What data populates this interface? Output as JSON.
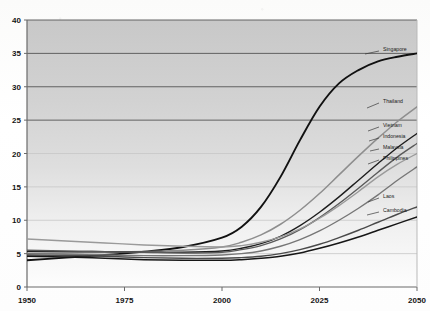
{
  "chart_data": {
    "type": "line",
    "title": "",
    "subtitle": "",
    "xlabel": "",
    "ylabel": "",
    "xlim": [
      1950,
      2050
    ],
    "ylim": [
      0,
      40
    ],
    "x_ticks": [
      "1950",
      "1975",
      "2000",
      "2025",
      "2050"
    ],
    "x_tick_values": [
      1950,
      1975,
      2000,
      2025,
      2050
    ],
    "y_ticks": [
      "0",
      "5",
      "10",
      "15",
      "20",
      "25",
      "30",
      "35",
      "40"
    ],
    "y_tick_values": [
      0,
      5,
      10,
      15,
      20,
      25,
      30,
      35,
      40
    ],
    "grid": "horizontal",
    "legend_position": "right-inline-labels",
    "plot_background": "#d0d0d0",
    "x": [
      1950,
      1960,
      1970,
      1980,
      1990,
      2000,
      2005,
      2010,
      2015,
      2020,
      2025,
      2030,
      2035,
      2040,
      2045,
      2050
    ],
    "series": [
      {
        "name": "Singapore",
        "color": "#111111",
        "width": 1.9,
        "values": [
          4.0,
          4.4,
          4.8,
          5.3,
          6.0,
          7.4,
          9.0,
          12.0,
          16.5,
          22.0,
          27.0,
          30.5,
          32.5,
          33.8,
          34.5,
          35.0
        ]
      },
      {
        "name": "Thailand",
        "color": "#8e8e8e",
        "width": 1.5,
        "values": [
          5.0,
          5.1,
          5.2,
          5.3,
          5.5,
          6.0,
          6.7,
          7.8,
          9.4,
          11.5,
          14.0,
          16.8,
          19.6,
          22.3,
          24.8,
          27.0
        ]
      },
      {
        "name": "Vietnam",
        "color": "#1d1d1d",
        "width": 1.4,
        "values": [
          5.3,
          5.3,
          5.3,
          5.2,
          5.2,
          5.4,
          5.8,
          6.5,
          7.6,
          9.2,
          11.2,
          13.5,
          16.0,
          18.5,
          20.9,
          23.0
        ]
      },
      {
        "name": "Indonesia",
        "color": "#5a5a5a",
        "width": 1.4,
        "values": [
          5.5,
          5.4,
          5.3,
          5.2,
          5.1,
          5.2,
          5.6,
          6.2,
          7.2,
          8.6,
          10.4,
          12.5,
          14.8,
          17.2,
          19.5,
          21.5
        ]
      },
      {
        "name": "Malaysia",
        "color": "#9a9a9a",
        "width": 1.4,
        "values": [
          7.2,
          6.9,
          6.6,
          6.3,
          6.1,
          6.0,
          6.2,
          6.7,
          7.5,
          8.7,
          10.3,
          12.2,
          14.3,
          16.5,
          18.4,
          20.0
        ]
      },
      {
        "name": "Philippines",
        "color": "#767676",
        "width": 1.4,
        "values": [
          5.0,
          4.9,
          4.8,
          4.7,
          4.7,
          4.8,
          5.0,
          5.4,
          6.1,
          7.1,
          8.4,
          10.0,
          11.8,
          13.8,
          16.0,
          18.0
        ]
      },
      {
        "name": "Laos",
        "color": "#4a4a4a",
        "width": 1.4,
        "values": [
          4.8,
          4.7,
          4.6,
          4.4,
          4.3,
          4.3,
          4.4,
          4.6,
          5.0,
          5.6,
          6.4,
          7.4,
          8.5,
          9.7,
          10.9,
          12.0
        ]
      },
      {
        "name": "Cambodia",
        "color": "#161616",
        "width": 1.5,
        "values": [
          4.6,
          4.5,
          4.3,
          4.1,
          4.0,
          4.0,
          4.1,
          4.3,
          4.6,
          5.1,
          5.8,
          6.6,
          7.5,
          8.5,
          9.5,
          10.5
        ]
      }
    ],
    "annotations": [
      {
        "label": "Singapore",
        "x": 383,
        "y": 49,
        "leader": [
          379,
          51,
          365,
          54
        ]
      },
      {
        "label": "Thailand",
        "x": 383,
        "y": 101,
        "leader": [
          379,
          103,
          367,
          108
        ]
      },
      {
        "label": "Vietnam",
        "x": 383,
        "y": 125,
        "leader": [
          379,
          127,
          368,
          131
        ]
      },
      {
        "label": "Indonesia",
        "x": 383,
        "y": 136,
        "leader": [
          379,
          138,
          369,
          141
        ]
      },
      {
        "label": "Malaysia",
        "x": 383,
        "y": 147,
        "leader": [
          379,
          149,
          370,
          151
        ]
      },
      {
        "label": "Philippines",
        "x": 383,
        "y": 158,
        "leader": [
          379,
          160,
          368,
          164
        ]
      },
      {
        "label": "Laos",
        "x": 383,
        "y": 196,
        "leader": [
          379,
          198,
          368,
          202
        ]
      },
      {
        "label": "Cambodia",
        "x": 383,
        "y": 210,
        "leader": [
          379,
          212,
          367,
          215
        ]
      }
    ]
  }
}
